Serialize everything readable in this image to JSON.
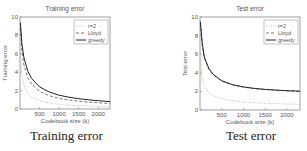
{
  "chart_data": [
    {
      "type": "line",
      "title": "Training error",
      "caption": "Training error",
      "xlabel": "Codebook size (k)",
      "ylabel": "Training error",
      "xlim": [
        0,
        2300
      ],
      "ylim": [
        0,
        10
      ],
      "xticks": [
        500,
        1000,
        1500,
        2000
      ],
      "yticks": [
        0,
        2,
        4,
        6,
        8,
        10
      ],
      "grid": false,
      "legend_position": "upper right",
      "x": [
        10,
        50,
        100,
        200,
        300,
        500,
        750,
        1000,
        1250,
        1500,
        1750,
        2000,
        2300
      ],
      "series": [
        {
          "name": "r=2",
          "style": "dotted",
          "values": [
            6.0,
            3.6,
            2.6,
            1.7,
            1.3,
            0.9,
            0.65,
            0.5,
            0.42,
            0.36,
            0.32,
            0.28,
            0.25
          ]
        },
        {
          "name": "Lloyd",
          "style": "dashed",
          "values": [
            8.8,
            6.2,
            4.8,
            3.4,
            2.7,
            1.9,
            1.45,
            1.15,
            0.98,
            0.85,
            0.75,
            0.67,
            0.6
          ]
        },
        {
          "name": "greedy",
          "style": "solid",
          "values": [
            9.4,
            7.0,
            5.6,
            4.1,
            3.3,
            2.4,
            1.85,
            1.5,
            1.28,
            1.12,
            1.0,
            0.9,
            0.8
          ]
        }
      ]
    },
    {
      "type": "line",
      "title": "Test error",
      "caption": "Test error",
      "xlabel": "Codebook size (k)",
      "ylabel": "Test error",
      "xlim": [
        0,
        2300
      ],
      "ylim": [
        0,
        10
      ],
      "xticks": [
        500,
        1000,
        1500,
        2000
      ],
      "yticks": [
        0,
        2,
        4,
        6,
        8,
        10
      ],
      "grid": false,
      "legend_position": "upper right",
      "x": [
        10,
        50,
        100,
        200,
        300,
        500,
        750,
        1000,
        1250,
        1500,
        1750,
        2000,
        2300
      ],
      "series": [
        {
          "name": "r=2",
          "style": "dotted",
          "values": [
            5.5,
            3.4,
            2.6,
            1.9,
            1.55,
            1.2,
            1.0,
            0.85,
            0.78,
            0.72,
            0.68,
            0.65,
            0.62
          ]
        },
        {
          "name": "Lloyd",
          "style": "dashed",
          "values": [
            9.3,
            7.0,
            5.6,
            4.4,
            3.8,
            3.1,
            2.7,
            2.45,
            2.3,
            2.2,
            2.12,
            2.06,
            2.0
          ]
        },
        {
          "name": "greedy",
          "style": "solid",
          "values": [
            9.5,
            7.2,
            5.7,
            4.5,
            3.85,
            3.15,
            2.72,
            2.48,
            2.32,
            2.22,
            2.14,
            2.08,
            2.02
          ]
        }
      ]
    }
  ],
  "figures": {
    "left": {
      "title": "Training error",
      "xlabel": "Codebook size (k)",
      "ylabel": "Training error",
      "caption": "Training error",
      "legend": [
        "r=2",
        "Lloyd",
        "greedy"
      ]
    },
    "right": {
      "title": "Test error",
      "xlabel": "Codebook size (k)",
      "ylabel": "Test error",
      "caption": "Test error",
      "legend": [
        "r=2",
        "Lloyd",
        "greedy"
      ]
    }
  }
}
